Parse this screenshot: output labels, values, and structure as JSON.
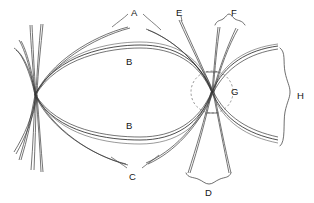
{
  "figure": {
    "type": "ray-bundle-caustic-diagram",
    "width": 314,
    "height": 203,
    "background_color": "#ffffff",
    "stroke_color": "#3a3a3a",
    "label_color": "#151515"
  },
  "labels": {
    "a": "A",
    "b_upper": "B",
    "b_lower": "B",
    "c": "C",
    "d": "D",
    "e": "E",
    "f": "F",
    "g": "G",
    "h": "H"
  },
  "label_positions": {
    "a": {
      "x": 131,
      "y": 8
    },
    "b_upper": {
      "x": 126,
      "y": 57
    },
    "b_lower": {
      "x": 126,
      "y": 121
    },
    "c": {
      "x": 129,
      "y": 172
    },
    "d": {
      "x": 209,
      "y": 189
    },
    "e": {
      "x": 178,
      "y": 8
    },
    "f": {
      "x": 233,
      "y": 8
    },
    "g": {
      "x": 230,
      "y": 88
    },
    "h": {
      "x": 299,
      "y": 91
    }
  },
  "nodes": {
    "left_focus": {
      "x": 35,
      "y": 95,
      "name": "left-crossing-point"
    },
    "right_focus": {
      "x": 212,
      "y": 92,
      "name": "right-crossing-point"
    }
  },
  "annotations": {
    "dashed_circle": {
      "cx": 212,
      "cy": 92,
      "r": 21,
      "dash": "2.2 2.2"
    },
    "brace_f": {
      "orientation": "horizontal",
      "x1": 215,
      "x2": 245,
      "y": 23
    },
    "brace_d": {
      "orientation": "horizontal",
      "x1": 186,
      "x2": 231,
      "y": 178
    },
    "brace_h": {
      "orientation": "vertical",
      "y1": 48,
      "y2": 146,
      "x": 287
    }
  },
  "legend_meaning": {
    "a": "outer divergent ray envelope (upper)",
    "b": "inner lens-shaped ray bundle",
    "c": "outer divergent ray envelope (lower)",
    "d": "downward diverging ray fan width",
    "e": "steep near-vertical ray pair",
    "f": "upward emergent ray pair",
    "g": "second focal crossing region",
    "h": "emergent ray bundle span"
  }
}
